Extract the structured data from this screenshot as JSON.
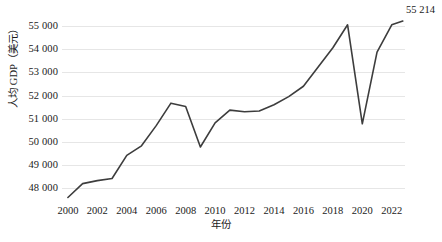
{
  "chart_data": {
    "type": "line",
    "title": "",
    "subtitle": "",
    "xlabel": "年份",
    "ylabel": "人均 GDP（美元）",
    "xlim": [
      1999.6,
      2022.9
    ],
    "ylim": [
      47450,
      55300
    ],
    "ytick_values": [
      48000,
      49000,
      50000,
      51000,
      52000,
      53000,
      54000,
      55000
    ],
    "ytick_labels": [
      "48 000",
      "49 000",
      "50 000",
      "51 000",
      "52 000",
      "53 000",
      "54 000",
      "55 000"
    ],
    "xtick_values": [
      2000,
      2002,
      2004,
      2006,
      2008,
      2010,
      2012,
      2014,
      2016,
      2018,
      2020,
      2022
    ],
    "xtick_labels": [
      "2000",
      "2002",
      "2004",
      "2006",
      "2008",
      "2010",
      "2012",
      "2014",
      "2016",
      "2018",
      "2020",
      "2022"
    ],
    "grid": "horizontal",
    "legend": "none",
    "line_color": "#3d3d3d",
    "line_width": 1.6,
    "markers": "none",
    "x": [
      2000,
      2001,
      2002,
      2003,
      2004,
      2005,
      2006,
      2007,
      2008,
      2009,
      2010,
      2011,
      2012,
      2013,
      2014,
      2015,
      2016,
      2017,
      2018,
      2019,
      2020,
      2021,
      2022
    ],
    "values": [
      47600,
      48200,
      48330,
      48420,
      49420,
      49830,
      50700,
      51670,
      51530,
      49780,
      50820,
      51370,
      51300,
      51330,
      51600,
      51950,
      52400,
      53230,
      54060,
      55050,
      50780,
      53870,
      55050
    ],
    "series": [
      {
        "name": "人均 GDP（美元）",
        "values": [
          47600,
          48200,
          48330,
          48420,
          49420,
          49830,
          50700,
          51670,
          51530,
          49780,
          50820,
          51370,
          51300,
          51330,
          51600,
          51950,
          52400,
          53230,
          54060,
          55050,
          50780,
          53870,
          55050
        ]
      }
    ],
    "annotations": [
      {
        "name": "end-value-label",
        "text": "55 214",
        "x": 2022,
        "y": 55214
      }
    ]
  },
  "axes": {
    "y_title": "人均 GDP（美元）",
    "x_title": "年份"
  },
  "labels": {
    "end_value": "55 214"
  }
}
